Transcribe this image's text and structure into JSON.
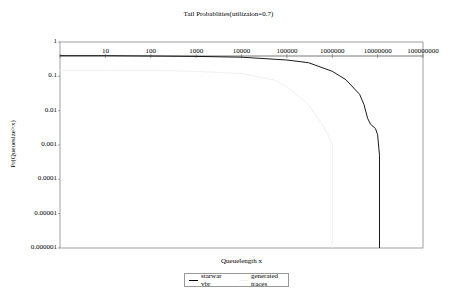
{
  "chart_data": {
    "type": "line",
    "title": "Tail Probablities(utilizaion=0.7)",
    "xlabel": "Queuelength x",
    "ylabel": "Pr(Queuesize>x)",
    "xscale": "log",
    "yscale": "log",
    "xlim": [
      1,
      100000000
    ],
    "ylim": [
      1e-06,
      1
    ],
    "x_tick_labels": [
      "1",
      "10",
      "100",
      "1000",
      "10000",
      "100000",
      "1000000",
      "10000000",
      "100000000"
    ],
    "y_tick_labels": [
      "1",
      "0.1",
      "0.01",
      "0.001",
      "0.0001",
      "0.00001",
      "0.000001"
    ],
    "grid": false,
    "legend_position": "bottom",
    "series": [
      {
        "name": "starwar vbr",
        "color": "#000000",
        "x": [
          1,
          10,
          100,
          1000,
          10000,
          100000,
          300000,
          1000000,
          2000000,
          4000000,
          5000000,
          6000000,
          7000000,
          9000000,
          10000000,
          11000000,
          11000000
        ],
        "y": [
          0.4,
          0.4,
          0.39,
          0.38,
          0.36,
          0.3,
          0.25,
          0.14,
          0.08,
          0.03,
          0.015,
          0.006,
          0.004,
          0.003,
          0.002,
          0.0005,
          1e-06
        ]
      },
      {
        "name": "generated traces",
        "color": "#f0f0f0",
        "x": [
          1,
          10,
          100,
          1000,
          10000,
          50000,
          100000,
          300000,
          600000,
          800000,
          1000000,
          1000000
        ],
        "y": [
          0.15,
          0.15,
          0.15,
          0.14,
          0.12,
          0.08,
          0.05,
          0.015,
          0.004,
          0.002,
          0.001,
          1e-06
        ]
      }
    ]
  }
}
